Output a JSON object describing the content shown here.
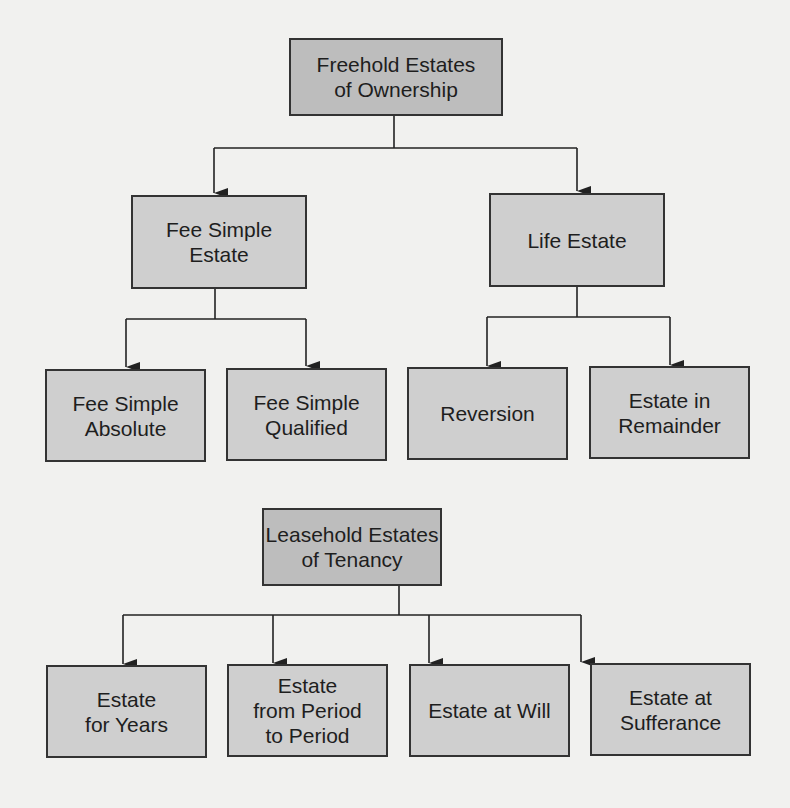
{
  "diagram": {
    "freehold": {
      "root": "Freehold Estates\nof Ownership",
      "children": [
        {
          "label": "Fee Simple\nEstate",
          "children": [
            "Fee Simple\nAbsolute",
            "Fee Simple\nQualified"
          ]
        },
        {
          "label": "Life Estate",
          "children": [
            "Reversion",
            "Estate in\nRemainder"
          ]
        }
      ]
    },
    "leasehold": {
      "root": "Leasehold Estates\nof Tenancy",
      "children": [
        "Estate\nfor Years",
        "Estate\nfrom Period\nto Period",
        "Estate at Will",
        "Estate at\nSufferance"
      ]
    },
    "colors": {
      "background": "#f1f1ef",
      "root_box": "#bdbdbd",
      "child_box": "#cfcfcf",
      "border": "#333333"
    }
  }
}
